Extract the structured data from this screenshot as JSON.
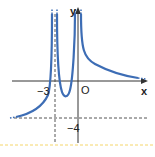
{
  "diagram": {
    "type": "function-graph",
    "axes": {
      "x_label": "x",
      "y_label": "y",
      "origin_label": "O"
    },
    "annotations": {
      "x_tick_label": "−3",
      "y_tick_label": "−4"
    },
    "asymptotes": {
      "vertical": [
        -3,
        0
      ],
      "horizontal": [
        -4,
        0
      ]
    },
    "colors": {
      "curve": "#3d6db5",
      "axes": "#333333",
      "dashed": "#555555",
      "separator": "#f5d66b"
    }
  }
}
